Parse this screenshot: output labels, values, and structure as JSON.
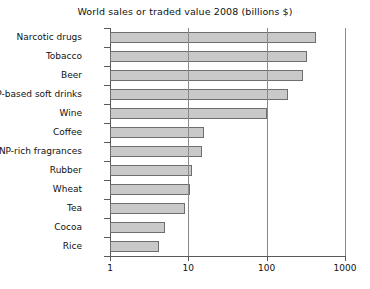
{
  "chart_data": {
    "type": "bar",
    "orientation": "horizontal",
    "title": "World sales or traded value 2008 (billions $)",
    "xlabel": "",
    "ylabel": "",
    "xscale": "log",
    "xlim": [
      1,
      1000
    ],
    "xticks": [
      1,
      10,
      100,
      1000
    ],
    "xticklabels": [
      "1",
      "10",
      "100",
      "1000"
    ],
    "grid": "vertical gridlines at 10, 100, 1000",
    "legend": "none",
    "categories": [
      "Narcotic drugs",
      "Tobacco",
      "Beer",
      "NP-based soft drinks",
      "Wine",
      "Coffee",
      "NP-rich fragrances",
      "Rubber",
      "Wheat",
      "Tea",
      "Cocoa",
      "Rice"
    ],
    "values": [
      430,
      330,
      290,
      185,
      100,
      16,
      15,
      11,
      10.5,
      9,
      5,
      4.2
    ],
    "units": "billions of US dollars"
  },
  "axis": {
    "x_tick_labels": [
      "1",
      "10",
      "100",
      "1000"
    ]
  }
}
